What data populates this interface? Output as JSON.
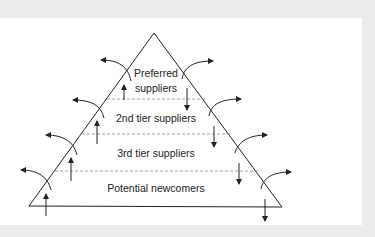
{
  "diagram": {
    "type": "supplier-pyramid",
    "tiers": [
      {
        "id": "preferred",
        "label_lines": [
          "Preferred",
          "suppliers"
        ]
      },
      {
        "id": "second-tier",
        "label_lines": [
          "2nd tier suppliers"
        ]
      },
      {
        "id": "third-tier",
        "label_lines": [
          "3rd tier suppliers"
        ]
      },
      {
        "id": "potential-newcomers",
        "label_lines": [
          "Potential newcomers"
        ]
      }
    ],
    "flows": {
      "upward_promotion": "arrows pointing up on left side of each tier",
      "downward_demotion": "arrows pointing down on right side of each tier",
      "exit_left": "curved arrows leaving pyramid to the left",
      "exit_right": "curved arrows leaving pyramid to the right"
    },
    "colors": {
      "frame": "#ebebeb",
      "background": "#ffffff",
      "stroke": "#222222",
      "dashed": "#888888"
    }
  }
}
